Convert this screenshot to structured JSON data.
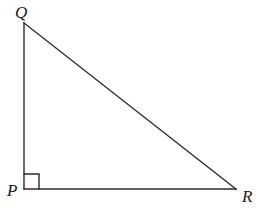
{
  "figure": {
    "name": "right-triangle-PQR",
    "background_color": "#ffffff",
    "stroke_color": "#2b2b2b",
    "stroke_width": 1.4,
    "labels": {
      "Q": "Q",
      "P": "P",
      "R": "R"
    },
    "right_angle_at": "P",
    "right_angle_marker": {
      "size_px": 15,
      "shape": "square"
    }
  },
  "chart_data": {
    "type": "diagram",
    "title": "",
    "shape": "right triangle",
    "vertices": [
      {
        "name": "Q",
        "x": 24,
        "y": 23,
        "label_position": "above-left"
      },
      {
        "name": "P",
        "x": 24,
        "y": 189,
        "label_position": "left"
      },
      {
        "name": "R",
        "x": 236,
        "y": 189,
        "label_position": "right"
      }
    ],
    "edges": [
      {
        "from": "Q",
        "to": "P",
        "name": "QP",
        "role": "leg"
      },
      {
        "from": "P",
        "to": "R",
        "name": "PR",
        "role": "leg"
      },
      {
        "from": "Q",
        "to": "R",
        "name": "QR",
        "role": "hypotenuse"
      }
    ],
    "angles": [
      {
        "vertex": "P",
        "measure_deg": 90,
        "marked": true
      }
    ],
    "grid": false,
    "legend": null
  }
}
